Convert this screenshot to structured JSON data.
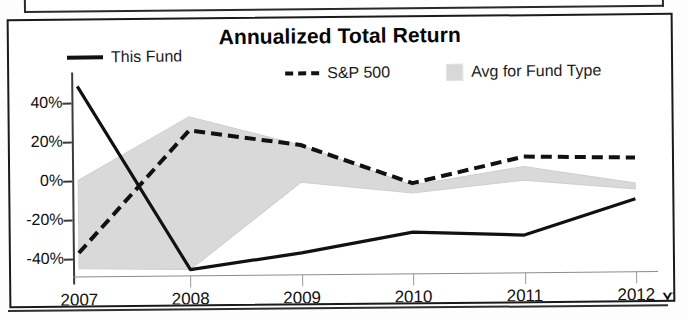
{
  "chart_data": {
    "type": "line",
    "title": "Annualized Total Return",
    "xlabel": "",
    "ylabel": "",
    "categories": [
      "2007",
      "2008",
      "2009",
      "2010",
      "2011",
      "2012"
    ],
    "last_category_suffix": "YTD",
    "ytick_labels": [
      "40%",
      "20%",
      "0%",
      "-20%",
      "-40%"
    ],
    "ytick_values": [
      40,
      20,
      0,
      -20,
      -40
    ],
    "ylim": [
      -50,
      52
    ],
    "grid": false,
    "legend_position": "top",
    "series": [
      {
        "name": "This Fund",
        "style": "solid",
        "color": "#111111",
        "values": [
          48,
          -46,
          -38,
          -28,
          -30,
          -12
        ]
      },
      {
        "name": "S&P 500",
        "style": "dashed",
        "color": "#111111",
        "values": [
          -37,
          25,
          17,
          -3,
          10,
          9
        ]
      },
      {
        "name": "Avg for Fund Type",
        "style": "band",
        "color": "#d9d9d9",
        "upper": [
          0,
          32,
          17,
          -4,
          5,
          -4
        ],
        "lower": [
          -45,
          -46,
          -2,
          -8,
          -2,
          -7
        ]
      }
    ]
  },
  "chart": {
    "title": "Annualized Total Return",
    "legend": [
      {
        "label": "This Fund",
        "marker": "solid-line-icon"
      },
      {
        "label": "S&P 500",
        "marker": "dashed-line-icon"
      },
      {
        "label": "Avg for Fund Type",
        "marker": "gray-swatch-icon"
      }
    ],
    "ytd_note": "YTD"
  }
}
